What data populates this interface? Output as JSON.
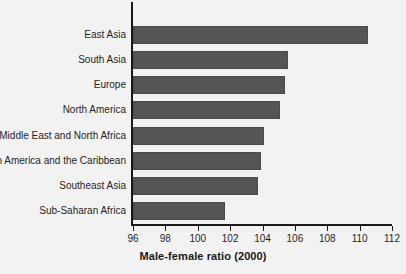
{
  "chart_data": {
    "type": "bar",
    "orientation": "horizontal",
    "title": "",
    "xlabel": "Male-female ratio (2000)",
    "ylabel": "",
    "xlim": [
      96,
      112
    ],
    "xticks": [
      96,
      98,
      100,
      102,
      104,
      106,
      108,
      110,
      112
    ],
    "grid": false,
    "legend": false,
    "bar_color": "#555555",
    "background_color": "#f2f2f2",
    "axis_color": "#1a1a1a",
    "categories": [
      "East Asia",
      "South Asia",
      "Europe",
      "North America",
      "Middle East and North Africa",
      "Latin America and the Caribbean",
      "Southeast Asia",
      "Sub-Saharan Africa"
    ],
    "values": [
      110.5,
      105.6,
      105.4,
      105.1,
      104.1,
      103.9,
      103.7,
      101.7
    ]
  }
}
